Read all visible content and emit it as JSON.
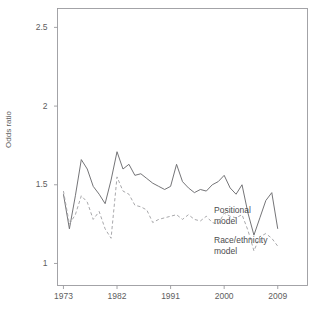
{
  "figure": {
    "title_fragment": "",
    "background": "#ffffff",
    "axis_color": "#9a9a9e"
  },
  "chart_data": {
    "type": "line",
    "title": "",
    "xlabel": "",
    "ylabel": "Odds ratio",
    "xlim": [
      1972,
      2014
    ],
    "ylim": [
      0.86,
      2.62
    ],
    "grid": false,
    "legend_position": "right-inline",
    "yticks": [
      1,
      1.5,
      2,
      2.5
    ],
    "ytick_labels": [
      "1",
      "1.5",
      "2",
      "2.5"
    ],
    "xticks": [
      1973,
      1982,
      1991,
      2000,
      2009
    ],
    "xtick_labels": [
      "1973",
      "1982",
      "1991",
      "2000",
      "2009"
    ],
    "x": [
      1973,
      1974,
      1975,
      1976,
      1977,
      1978,
      1979,
      1980,
      1981,
      1982,
      1983,
      1984,
      1985,
      1986,
      1987,
      1988,
      1989,
      1990,
      1991,
      1992,
      1993,
      1994,
      1995,
      1996,
      1997,
      1998,
      1999,
      2000,
      2001,
      2002,
      2003,
      2004,
      2005,
      2006,
      2007,
      2008,
      2009
    ],
    "series": [
      {
        "name": "Positional model",
        "label_lines": [
          "Positional",
          "model"
        ],
        "style": "solid",
        "color": "#6d6d70",
        "values": [
          1.44,
          1.22,
          1.43,
          1.66,
          1.6,
          1.49,
          1.44,
          1.38,
          1.53,
          1.71,
          1.6,
          1.63,
          1.56,
          1.57,
          1.54,
          1.51,
          1.49,
          1.47,
          1.49,
          1.63,
          1.52,
          1.48,
          1.45,
          1.47,
          1.46,
          1.5,
          1.52,
          1.56,
          1.48,
          1.44,
          1.5,
          1.32,
          1.18,
          1.29,
          1.4,
          1.45,
          1.22
        ]
      },
      {
        "name": "Race/ethnicity model",
        "label_lines": [
          "Race/ethnicity",
          "model"
        ],
        "style": "dashed",
        "color": "#a3a3a6",
        "values": [
          1.46,
          1.25,
          1.31,
          1.43,
          1.39,
          1.28,
          1.33,
          1.22,
          1.16,
          1.55,
          1.46,
          1.44,
          1.37,
          1.36,
          1.34,
          1.26,
          1.28,
          1.29,
          1.3,
          1.31,
          1.28,
          1.31,
          1.28,
          1.27,
          1.3,
          1.26,
          1.25,
          1.32,
          1.3,
          1.29,
          1.31,
          1.21,
          1.08,
          1.17,
          1.19,
          1.16,
          1.11
        ]
      }
    ]
  }
}
